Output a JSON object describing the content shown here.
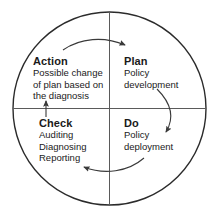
{
  "diagram": {
    "name": "pdca-cycle",
    "title": "",
    "shape": "circle-with-cross-axes",
    "colors": {
      "outline": "#2b2b2b",
      "axis": "#555555",
      "arrow": "#3a3a3a",
      "text": "#1a1a1a",
      "background": "#ffffff"
    },
    "geometry": {
      "center_x": 109.5,
      "center_y": 108.5,
      "radius": 96.5,
      "outline_width": 1.4,
      "axis_width": 1.0
    },
    "quadrants": [
      {
        "id": "action",
        "position": "top-left",
        "title": "Action",
        "lines": [
          "Possible change",
          "of plan based on",
          "the diagnosis"
        ]
      },
      {
        "id": "plan",
        "position": "top-right",
        "title": "Plan",
        "lines": [
          "Policy",
          "development"
        ]
      },
      {
        "id": "check",
        "position": "bottom-left",
        "title": "Check",
        "lines": [
          "Auditing",
          "Diagnosing",
          "Reporting"
        ]
      },
      {
        "id": "do",
        "position": "bottom-right",
        "title": "Do",
        "lines": [
          "Policy",
          "deployment"
        ]
      }
    ],
    "arrows": [
      {
        "id": "action-to-plan",
        "from": "Action",
        "to": "Plan",
        "direction": "clockwise-top",
        "head": "right"
      },
      {
        "id": "plan-to-do",
        "from": "Plan",
        "to": "Do",
        "direction": "clockwise-right",
        "head": "down"
      },
      {
        "id": "do-to-check",
        "from": "Do",
        "to": "Check",
        "direction": "clockwise-bottom",
        "head": "left"
      },
      {
        "id": "check-to-action",
        "from": "Check",
        "to": "Action",
        "direction": "clockwise-left",
        "head": "up"
      }
    ]
  }
}
